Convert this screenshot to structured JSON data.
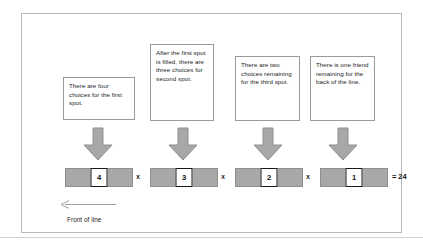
{
  "figure": {
    "callouts": [
      {
        "id": "first-spot",
        "text": "There are four choices for the first spot."
      },
      {
        "id": "second-spot",
        "text": "After the first spot is filled, there are three choices for second spot."
      },
      {
        "id": "third-spot",
        "text": "There are two choices remaining for the third spot."
      },
      {
        "id": "fourth-spot",
        "text": "There is one friend remaining for the back of the line."
      }
    ],
    "slots": [
      {
        "id": "slot-1",
        "value": "4"
      },
      {
        "id": "slot-2",
        "value": "3"
      },
      {
        "id": "slot-3",
        "value": "2"
      },
      {
        "id": "slot-4",
        "value": "1"
      }
    ],
    "operators": [
      "x",
      "x",
      "x"
    ],
    "result": "= 24",
    "front_of_line_label": "Front of line",
    "colors": {
      "frame_border": "#b9b9b9",
      "callout_border": "#9a9a9a",
      "bar_fill": "#a8a8a8",
      "bar_border": "#8f8f8f",
      "arrow_fill": "#a8a8a8",
      "arrow_border": "#8f8f8f",
      "value_box_border": "#1a1a1a",
      "text": "#1c1c1c",
      "front_arrow": "#9e9e9e"
    }
  }
}
